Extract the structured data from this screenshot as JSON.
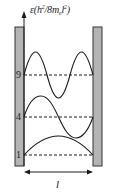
{
  "diagram": {
    "y_axis": {
      "symbol": "ε",
      "unit_open": "(h",
      "unit_sup1": "2",
      "unit_mid": "/8m",
      "unit_sub": "e",
      "unit_l": "l",
      "unit_sup2": "2",
      "unit_close": ")"
    },
    "x_axis": {
      "label": "l"
    },
    "energy_levels": [
      {
        "n": 1,
        "value": "1",
        "y": 155
      },
      {
        "n": 2,
        "value": "4",
        "y": 117
      },
      {
        "n": 3,
        "value": "9",
        "y": 75
      }
    ],
    "colors": {
      "wall_fill": "#b4b4b4",
      "wall_stroke": "#333333",
      "line": "#1a1a1a"
    }
  }
}
